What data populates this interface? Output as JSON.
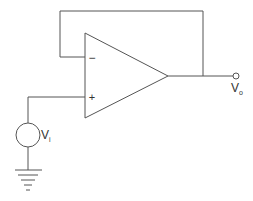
{
  "diagram": {
    "type": "op-amp voltage follower",
    "opamp": {
      "inverting_symbol": "−",
      "noninverting_symbol": "+"
    },
    "labels": {
      "input_main": "V",
      "input_sub": "i",
      "output_main": "V",
      "output_sub": "o"
    },
    "colors": {
      "wire": "#555555",
      "background": "#ffffff",
      "text": "#333333"
    }
  }
}
